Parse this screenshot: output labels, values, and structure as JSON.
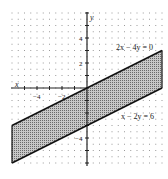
{
  "chart_data": {
    "type": "area",
    "title": "",
    "xlabel": "x",
    "ylabel": "y",
    "xlim": [
      -6,
      6
    ],
    "ylim": [
      -6,
      6
    ],
    "grid": "dotted",
    "x_ticks": [
      {
        "value": -4,
        "label": "-4"
      },
      {
        "value": -2,
        "label": "-2"
      }
    ],
    "y_ticks": [
      {
        "value": 4,
        "label": "4"
      },
      {
        "value": 2,
        "label": "2"
      },
      {
        "value": -4,
        "label": "-4"
      }
    ],
    "series": [
      {
        "name": "2x - 4y = 0",
        "equation": "y = x/2",
        "points": [
          [
            -6,
            -3
          ],
          [
            6,
            3
          ]
        ]
      },
      {
        "name": "x - 2y = 6",
        "equation": "y = (x-6)/2",
        "points": [
          [
            -6,
            -6
          ],
          [
            6,
            0
          ]
        ]
      }
    ],
    "shaded_region": {
      "description": "Region between the parallel lines 2x - 4y = 0 and x - 2y = 6",
      "vertices": [
        [
          -6,
          -3
        ],
        [
          6,
          3
        ],
        [
          6,
          0
        ],
        [
          -6,
          -6
        ]
      ]
    },
    "annotations": [
      {
        "text": "2x − 4y = 0",
        "x": 3.9,
        "y": 3.4
      },
      {
        "text": "x − 2y = 6",
        "x": 3.6,
        "y": -1.9
      }
    ]
  },
  "labels": {
    "x_axis": "x",
    "y_axis": "y",
    "line1": "2x − 4y = 0",
    "line2": "x − 2y = 6",
    "xt_m4": "−4",
    "xt_m2": "−2",
    "yt_4": "4",
    "yt_2": "2",
    "yt_m4": "−4"
  }
}
